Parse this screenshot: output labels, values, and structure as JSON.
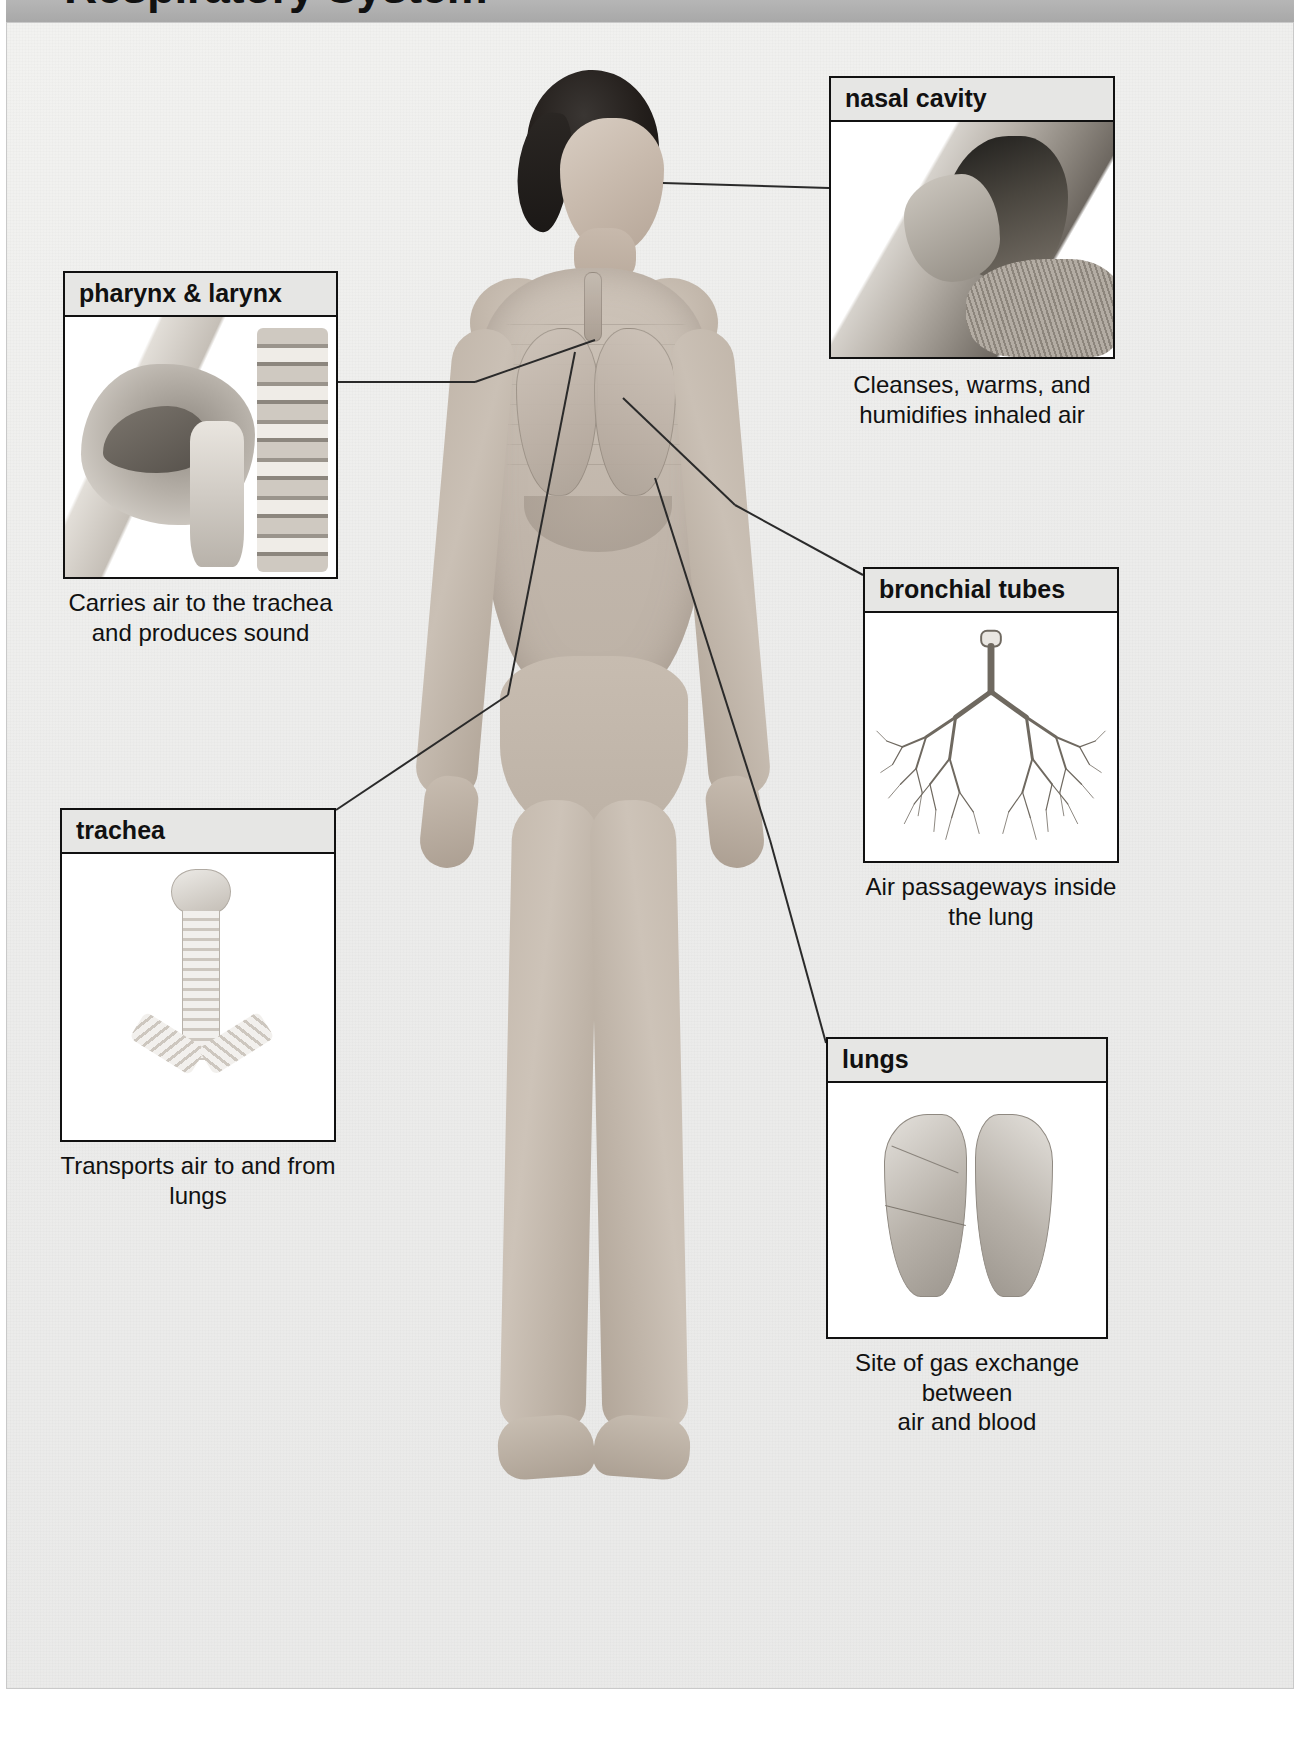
{
  "title": "Respiratory System",
  "figure": {
    "subject_label": "human-body-anterior-view"
  },
  "callouts": [
    {
      "id": "nasal-cavity",
      "header": "nasal cavity",
      "caption": "Cleanses, warms, and\nhumidifies inhaled air",
      "art": "sagittal-nasal-cavity-illustration"
    },
    {
      "id": "pharynx-larynx",
      "header": "pharynx & larynx",
      "caption": "Carries air to the trachea\nand produces sound",
      "art": "sagittal-head-neck-illustration"
    },
    {
      "id": "trachea",
      "header": "trachea",
      "caption": "Transports air to and from lungs",
      "art": "trachea-illustration"
    },
    {
      "id": "bronchial-tubes",
      "header": "bronchial tubes",
      "caption": "Air passageways inside\nthe lung",
      "art": "bronchial-tree-illustration"
    },
    {
      "id": "lungs",
      "header": "lungs",
      "caption": "Site of gas exchange between\nair and blood",
      "art": "lungs-illustration"
    }
  ],
  "colors": {
    "title_bar": "#ababab",
    "header_bar": "#e6e6e4",
    "border": "#111111",
    "canvas": "#ececeb",
    "panel": "#ffffff",
    "text": "#111111"
  }
}
